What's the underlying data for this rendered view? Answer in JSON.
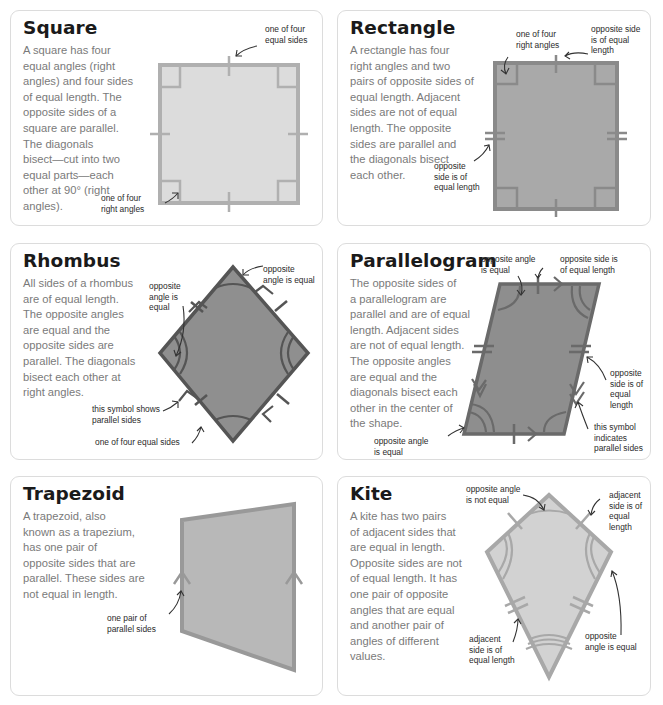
{
  "colors": {
    "card_border": "#dcdcdc",
    "title": "#1a1a1a",
    "body_text": "#7a7a7a",
    "annotation_text": "#2b2b2b",
    "square_fill": "#dcdcdc",
    "square_stroke": "#b0b0b0",
    "rectangle_fill": "#a9a9a9",
    "rectangle_stroke": "#8a8a8a",
    "rhombus_fill": "#8f8f8f",
    "rhombus_stroke": "#555555",
    "parallelogram_fill": "#8e8e8e",
    "parallelogram_stroke": "#6a6a6a",
    "trapezoid_fill": "#b8b8b8",
    "trapezoid_stroke": "#999999",
    "kite_fill": "#d2d2d2",
    "kite_stroke": "#a8a8a8"
  },
  "cards": {
    "square": {
      "title": "Square",
      "lines": [
        "A square has four",
        "equal angles (right",
        "angles) and four sides",
        "of equal length. The",
        "opposite sides of a",
        "square are parallel.",
        "The diagonals",
        "bisect—cut into two",
        "equal parts—each",
        "other at 90° (right",
        "angles)."
      ],
      "ann_sides": [
        "one of four",
        "equal sides"
      ],
      "ann_angles": [
        "one of four",
        "right angles"
      ]
    },
    "rectangle": {
      "title": "Rectangle",
      "lines": [
        "A rectangle has four",
        "right angles and two",
        "pairs of opposite sides of",
        "equal length. Adjacent",
        "sides are not of equal",
        "length. The opposite",
        "sides are parallel and",
        "the diagonals bisect",
        "each other."
      ],
      "ann_angles": [
        "one of four",
        "right angles"
      ],
      "ann_top": [
        "opposite side",
        "is of equal",
        "length"
      ],
      "ann_left": [
        "opposite",
        "side is of",
        "equal length"
      ]
    },
    "rhombus": {
      "title": "Rhombus",
      "lines": [
        "All sides of a rhombus",
        "are of equal length.",
        "The opposite angles",
        "are equal and the",
        "opposite sides are",
        "parallel. The diagonals",
        "bisect each other at",
        "right angles."
      ],
      "ann_top": [
        "opposite",
        "angle is equal"
      ],
      "ann_left": [
        "opposite",
        "angle is",
        "equal"
      ],
      "ann_parallel": [
        "this symbol shows",
        "parallel sides"
      ],
      "ann_sides": [
        "one of four equal sides"
      ]
    },
    "parallelogram": {
      "title": "Parallelogram",
      "lines": [
        "The opposite sides of",
        "a parallelogram are",
        "parallel and are of equal",
        "length. Adjacent sides",
        "are not of equal length.",
        "The opposite angles",
        "are equal and the",
        "diagonals bisect each",
        "other in the center of",
        "the shape."
      ],
      "ann_top_angle": [
        "opposite angle",
        "is equal"
      ],
      "ann_top_side": [
        "opposite side is",
        "of equal length"
      ],
      "ann_right_side": [
        "opposite",
        "side is of",
        "equal",
        "length"
      ],
      "ann_symbol": [
        "this symbol",
        "indicates",
        "parallel sides"
      ],
      "ann_bottom_angle": [
        "opposite angle",
        "is equal"
      ]
    },
    "trapezoid": {
      "title": "Trapezoid",
      "lines": [
        "A trapezoid, also",
        "known as a trapezium,",
        "has one pair of",
        "opposite sides that are",
        "parallel. These sides are",
        "not equal in length."
      ],
      "ann_parallel": [
        "one pair of",
        "parallel sides"
      ]
    },
    "kite": {
      "title": "Kite",
      "lines": [
        "A kite has two pairs",
        "of adjacent sides that",
        "are equal in length.",
        "Opposite sides are not",
        "of equal length. It has",
        "one pair of opposite",
        "angles that are equal",
        "and another pair of",
        "angles of different",
        "values."
      ],
      "ann_top": [
        "opposite angle",
        "is not equal"
      ],
      "ann_right_top": [
        "adjacent",
        "side is of",
        "equal",
        "length"
      ],
      "ann_left": [
        "adjacent",
        "side is of",
        "equal length"
      ],
      "ann_right": [
        "opposite",
        "angle is equal"
      ]
    }
  }
}
